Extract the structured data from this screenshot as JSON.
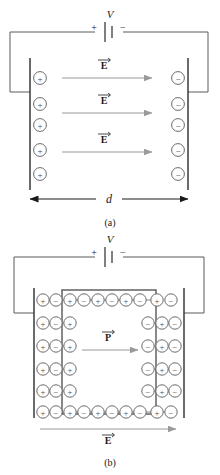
{
  "figure": {
    "type": "physics-diagram",
    "panels": [
      {
        "id": "a",
        "caption": "(a)",
        "battery": {
          "plus": "+",
          "minus": "−",
          "label": "V"
        },
        "left_plate_charges": [
          "+",
          "+",
          "+",
          "+",
          "+"
        ],
        "right_plate_charges": [
          "−",
          "−",
          "−",
          "−",
          "−"
        ],
        "field_arrows": [
          {
            "label": "E",
            "vector": true
          },
          {
            "label": "E",
            "vector": true
          },
          {
            "label": "E",
            "vector": true
          }
        ],
        "dimension": {
          "label": "d"
        }
      },
      {
        "id": "b",
        "caption": "(b)",
        "battery": {
          "plus": "+",
          "minus": "−",
          "label": "V"
        },
        "dipole_rows": [
          [
            "+",
            "−",
            "+",
            "−",
            "+",
            "−",
            "+",
            "−",
            "+",
            "−"
          ],
          [
            "+",
            "−",
            "+",
            "",
            "",
            "",
            "",
            "−",
            "+",
            "−"
          ],
          [
            "+",
            "−",
            "+",
            "",
            "",
            "",
            "",
            "−",
            "+",
            "−"
          ],
          [
            "+",
            "−",
            "+",
            "",
            "",
            "",
            "",
            "−",
            "+",
            "−"
          ],
          [
            "+",
            "−",
            "+",
            "",
            "",
            "",
            "",
            "−",
            "+",
            "−"
          ],
          [
            "+",
            "−",
            "+",
            "−",
            "+",
            "−",
            "+",
            "−",
            "+",
            "−"
          ]
        ],
        "polarization_arrow": {
          "label": "P",
          "vector": true
        },
        "field_arrow": {
          "label": "E",
          "vector": true
        }
      }
    ],
    "colors": {
      "ink": "#000000",
      "line": "#5a5a5a",
      "arrow": "#8c8c8c",
      "circle": "#6b6b6b",
      "box": "#4a4a4a",
      "background": "#ffffff"
    }
  }
}
